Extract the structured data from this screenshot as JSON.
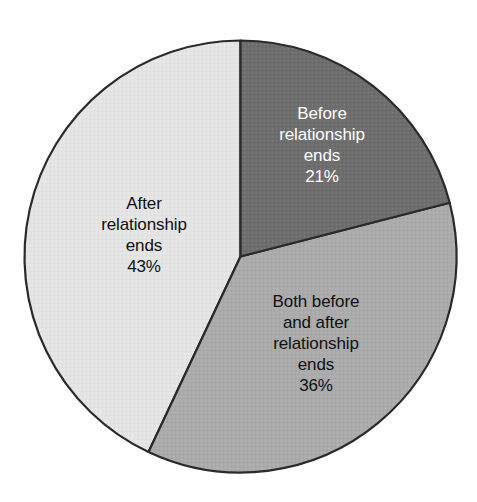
{
  "chart_data": {
    "type": "pie",
    "title": "",
    "subtitle": "",
    "xlabel": "",
    "ylabel": "",
    "legend_position": "none",
    "grid": false,
    "labels_inside_slices": true,
    "start_angle_deg": 0,
    "direction": "clockwise",
    "categories": [
      "Before relationship ends",
      "Both before and after relationship ends",
      "After relationship ends"
    ],
    "values": [
      21,
      36,
      43
    ],
    "value_unit": "%",
    "slices": [
      {
        "name": "Before relationship ends",
        "value": 21,
        "value_label": "21%",
        "color": "#6e6e6e",
        "text_color": "#ffffff",
        "label_lines": [
          "Before",
          "relationship",
          "ends",
          "21%"
        ]
      },
      {
        "name": "Both before and after relationship ends",
        "value": 36,
        "value_label": "36%",
        "color": "#ababab",
        "text_color": "#101010",
        "label_lines": [
          "Both before",
          "and after",
          "relationship",
          "ends",
          "36%"
        ]
      },
      {
        "name": "After relationship ends",
        "value": 43,
        "value_label": "43%",
        "color": "#e4e4e4",
        "text_color": "#101010",
        "label_lines": [
          "After",
          "relationship",
          "ends",
          "43%"
        ]
      }
    ]
  },
  "style": {
    "background": "#ffffff",
    "outline_color": "#2a2a2a",
    "outline_width": 2,
    "color_dark": "#6e6e6e",
    "color_medium": "#ababab",
    "color_light": "#e4e4e4"
  },
  "labels": {
    "before": {
      "line1": "Before",
      "line2": "relationship",
      "line3": "ends",
      "line4": "21%"
    },
    "both": {
      "line1": "Both before",
      "line2": "and after",
      "line3": "relationship",
      "line4": "ends",
      "line5": "36%"
    },
    "after": {
      "line1": "After",
      "line2": "relationship",
      "line3": "ends",
      "line4": "43%"
    }
  }
}
